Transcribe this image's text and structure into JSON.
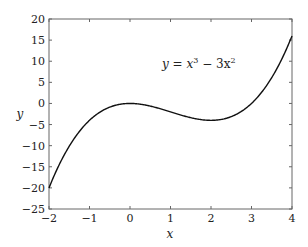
{
  "chart_data": {
    "type": "line",
    "title": "",
    "xlabel": "x",
    "ylabel": "y",
    "xlim": [
      -2,
      4
    ],
    "ylim": [
      -25,
      20
    ],
    "xticks": [
      -2,
      -1,
      0,
      1,
      2,
      3,
      4
    ],
    "yticks": [
      20,
      15,
      10,
      5,
      0,
      -5,
      -10,
      -15,
      -20,
      -25
    ],
    "xtick_labels": [
      "−2",
      "−1",
      "0",
      "1",
      "2",
      "3",
      "4"
    ],
    "ytick_labels": [
      "20",
      "15",
      "10",
      "5",
      "0",
      "−5",
      "−10",
      "−15",
      "−20",
      "−25"
    ],
    "grid": false,
    "legend": null,
    "annotation": {
      "text": "y = x³ − 3x²",
      "x": 1.6,
      "y": 11.5
    },
    "series": [
      {
        "name": "y = x^3 - 3x^2",
        "color": "#000000",
        "function": "x^3 - 3*x^2",
        "x": [
          -2,
          -1.5,
          -1,
          -0.5,
          0,
          0.5,
          1,
          1.5,
          2,
          2.5,
          3,
          3.5,
          4
        ],
        "y": [
          -20,
          -10.125,
          -4,
          -0.875,
          0,
          -0.625,
          -2,
          -3.375,
          -4,
          -3.125,
          0,
          6.125,
          16
        ]
      }
    ]
  },
  "labels": {
    "xlabel": "x",
    "ylabel": "y",
    "annotation_prefix": "y = x",
    "annotation_exp1": "3",
    "annotation_mid": " − 3x",
    "annotation_exp2": "2"
  }
}
